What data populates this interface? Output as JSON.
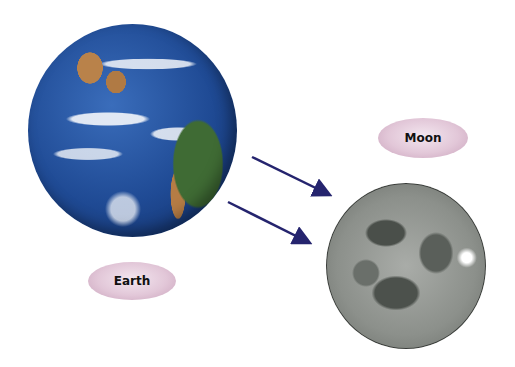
{
  "labels": {
    "earth": "Earth",
    "moon": "Moon"
  },
  "objects": [
    {
      "name": "Earth",
      "type": "planet-image"
    },
    {
      "name": "Moon",
      "type": "moon-image"
    }
  ],
  "arrows": [
    {
      "from": "Earth",
      "to": "Moon",
      "color": "#25246e"
    },
    {
      "from": "Earth",
      "to": "Moon",
      "color": "#25246e"
    }
  ],
  "colors": {
    "arrow": "#25246e",
    "label_fill": "#e2c7d8",
    "background": "#ffffff"
  }
}
